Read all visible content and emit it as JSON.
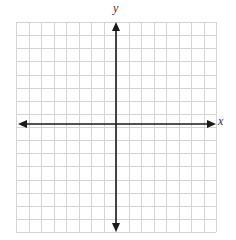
{
  "diagram": {
    "type": "coordinate-plane",
    "x_axis_label": "x",
    "y_axis_label": "y",
    "grid": {
      "columns": 16,
      "rows": 16,
      "left": 16,
      "top": 22,
      "width": 200,
      "height": 210,
      "line_color": "#d4d4d4"
    },
    "axes": {
      "color": "#1a1a1a",
      "x_axis_y": 124,
      "y_axis_x": 116,
      "x_arrow_left": 18,
      "x_arrow_right": 216,
      "y_arrow_top": 22,
      "y_arrow_bottom": 232
    }
  }
}
